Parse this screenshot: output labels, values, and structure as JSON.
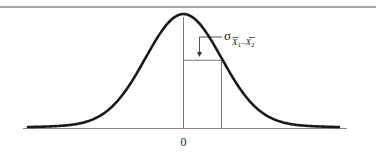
{
  "figure": {
    "type": "normal-distribution-diagram",
    "x_axis": {
      "tick_labels": [
        "0"
      ],
      "center_value": 0
    },
    "annotation": {
      "symbol": "σ",
      "subscript_parts": [
        "X",
        "1",
        "–",
        "X",
        "2"
      ],
      "subscript_bars": [
        true,
        false,
        false,
        true,
        false
      ],
      "meaning": "standard error of the difference between means",
      "marks_distance_sd": 1
    },
    "colors": {
      "curve": "#1a1a1a",
      "lines": "#555555",
      "text": "#222222",
      "background": "#ffffff"
    }
  }
}
